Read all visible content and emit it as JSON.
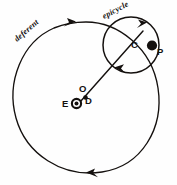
{
  "figure": {
    "background_color": "#fefefe",
    "ink_color": "#14100e"
  },
  "curves": {
    "deferent": {
      "label": "deferent",
      "center": [
        86,
        95
      ],
      "radius": 73,
      "direction_arrows": [
        "top-clockwise",
        "bottom-counter"
      ]
    },
    "epicycle": {
      "label": "epicycle",
      "center": [
        131,
        45
      ],
      "radius": 28,
      "direction_arrows": [
        "top-right",
        "bottom-left"
      ]
    }
  },
  "points": [
    {
      "id": "C",
      "label": "C",
      "marker": "crossing",
      "x": 131,
      "y": 45
    },
    {
      "id": "P",
      "label": "P",
      "marker": "filled-dot",
      "x": 152,
      "y": 46
    },
    {
      "id": "O",
      "label": "O",
      "marker": "none",
      "x": 83,
      "y": 88
    },
    {
      "id": "D",
      "label": "D",
      "marker": "small-dot",
      "x": 86,
      "y": 98
    },
    {
      "id": "E",
      "label": "E",
      "marker": "earth-symbol",
      "x": 75,
      "y": 104
    }
  ],
  "labels": {
    "deferent": "deferent",
    "epicycle": "epicycle",
    "point_c": "C",
    "point_p": "P",
    "point_o": "O",
    "point_d": "D",
    "point_e": "E"
  }
}
